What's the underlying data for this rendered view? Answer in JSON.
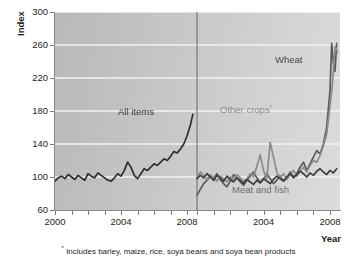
{
  "axes": {
    "ylabel": "Index",
    "xlabel": "Year",
    "yticks": [
      "60",
      "100",
      "140",
      "180",
      "220",
      "260",
      "300"
    ],
    "xticks_left": [
      "2000",
      "2004",
      "2008"
    ],
    "xticks_right": [
      "2004",
      "2008"
    ]
  },
  "labels": {
    "all_items": "All items",
    "wheat": "Wheat",
    "other_crops": "Other crops",
    "other_crops_star": "*",
    "meat_and_fish": "Meat and fish"
  },
  "footnote": {
    "star": "*",
    "text": "Includes barley, maize, rice, soya beans and soya bean products"
  },
  "colors": {
    "all_items": "#2f2f2f",
    "wheat": "#5a5a5a",
    "other_crops": "#8c8c8c",
    "meat_and_fish": "#3f3f3f",
    "gridline": "#f2f2f2",
    "axis": "#8a8a8a",
    "divider": "#7a7a7a",
    "plot_bg_left": "#bcbcbc",
    "plot_bg_right": "#dadada"
  },
  "chart_data": {
    "type": "line",
    "title": "",
    "xlabel": "Year",
    "ylabel": "Index",
    "ylim": [
      60,
      300
    ],
    "yticks": [
      60,
      100,
      140,
      180,
      220,
      260,
      300
    ],
    "grid": true,
    "legend": "inline-annotations",
    "panels": [
      {
        "name": "left",
        "xlim": [
          2000,
          2008.6
        ],
        "xticks": [
          2000,
          2004,
          2008
        ],
        "series": [
          {
            "name": "All items",
            "color": "#2f2f2f",
            "x": [
              2000.0,
              2000.2,
              2000.4,
              2000.6,
              2000.8,
              2001.0,
              2001.2,
              2001.4,
              2001.6,
              2001.8,
              2002.0,
              2002.2,
              2002.4,
              2002.6,
              2002.8,
              2003.0,
              2003.2,
              2003.4,
              2003.6,
              2003.8,
              2004.0,
              2004.2,
              2004.4,
              2004.6,
              2004.8,
              2005.0,
              2005.2,
              2005.4,
              2005.6,
              2005.8,
              2006.0,
              2006.2,
              2006.4,
              2006.6,
              2006.8,
              2007.0,
              2007.2,
              2007.4,
              2007.6,
              2007.8,
              2008.0,
              2008.2,
              2008.35
            ],
            "y": [
              95,
              99,
              101,
              98,
              103,
              100,
              97,
              102,
              99,
              96,
              104,
              101,
              99,
              105,
              102,
              99,
              96,
              95,
              99,
              104,
              101,
              108,
              118,
              112,
              102,
              98,
              104,
              110,
              108,
              112,
              116,
              114,
              118,
              122,
              120,
              125,
              131,
              129,
              134,
              140,
              150,
              163,
              176
            ]
          }
        ]
      },
      {
        "name": "right",
        "xlim": [
          2000,
          2008.6
        ],
        "xticks": [
          2004,
          2008
        ],
        "series": [
          {
            "name": "Wheat",
            "color": "#5a5a5a",
            "x": [
              2000.0,
              2000.2,
              2000.4,
              2000.6,
              2000.8,
              2001.0,
              2001.2,
              2001.4,
              2001.6,
              2001.8,
              2002.0,
              2002.2,
              2002.4,
              2002.6,
              2002.8,
              2003.0,
              2003.2,
              2003.4,
              2003.6,
              2003.8,
              2004.0,
              2004.2,
              2004.4,
              2004.6,
              2004.8,
              2005.0,
              2005.2,
              2005.4,
              2005.6,
              2005.8,
              2006.0,
              2006.2,
              2006.4,
              2006.6,
              2006.8,
              2007.0,
              2007.2,
              2007.4,
              2007.6,
              2007.8,
              2008.0,
              2008.1,
              2008.2,
              2008.3,
              2008.4
            ],
            "y": [
              78,
              85,
              92,
              96,
              101,
              98,
              104,
              97,
              92,
              88,
              95,
              103,
              99,
              94,
              90,
              96,
              101,
              106,
              99,
              93,
              97,
              104,
              98,
              92,
              96,
              101,
              95,
              99,
              106,
              100,
              104,
              112,
              118,
              108,
              116,
              124,
              132,
              128,
              140,
              160,
              205,
              262,
              238,
              228,
              262
            ]
          },
          {
            "name": "Other crops",
            "color": "#8c8c8c",
            "x": [
              2000.0,
              2000.2,
              2000.4,
              2000.6,
              2000.8,
              2001.0,
              2001.2,
              2001.4,
              2001.6,
              2001.8,
              2002.0,
              2002.2,
              2002.4,
              2002.6,
              2002.8,
              2003.0,
              2003.2,
              2003.4,
              2003.6,
              2003.8,
              2004.0,
              2004.2,
              2004.4,
              2004.6,
              2004.8,
              2005.0,
              2005.2,
              2005.4,
              2005.6,
              2005.8,
              2006.0,
              2006.2,
              2006.4,
              2006.6,
              2006.8,
              2007.0,
              2007.2,
              2007.4,
              2007.6,
              2007.8,
              2008.0,
              2008.15,
              2008.3,
              2008.45
            ],
            "y": [
              100,
              106,
              102,
              97,
              103,
              99,
              95,
              101,
              98,
              94,
              100,
              97,
              103,
              99,
              95,
              98,
              104,
              100,
              113,
              127,
              108,
              98,
              142,
              124,
              106,
              99,
              104,
              97,
              103,
              108,
              101,
              107,
              112,
              106,
              114,
              120,
              118,
              126,
              138,
              152,
              186,
              214,
              258,
              252
            ]
          },
          {
            "name": "Meat and fish",
            "color": "#3f3f3f",
            "x": [
              2000.0,
              2000.2,
              2000.4,
              2000.6,
              2000.8,
              2001.0,
              2001.2,
              2001.4,
              2001.6,
              2001.8,
              2002.0,
              2002.2,
              2002.4,
              2002.6,
              2002.8,
              2003.0,
              2003.2,
              2003.4,
              2003.6,
              2003.8,
              2004.0,
              2004.2,
              2004.4,
              2004.6,
              2004.8,
              2005.0,
              2005.2,
              2005.4,
              2005.6,
              2005.8,
              2006.0,
              2006.2,
              2006.4,
              2006.6,
              2006.8,
              2007.0,
              2007.2,
              2007.4,
              2007.6,
              2007.8,
              2008.0,
              2008.2,
              2008.4
            ],
            "y": [
              98,
              102,
              99,
              104,
              100,
              96,
              102,
              99,
              95,
              101,
              97,
              94,
              99,
              96,
              92,
              97,
              94,
              91,
              96,
              93,
              98,
              95,
              92,
              97,
              101,
              98,
              95,
              100,
              104,
              99,
              103,
              107,
              104,
              100,
              105,
              102,
              107,
              110,
              106,
              103,
              108,
              105,
              110
            ]
          }
        ]
      }
    ]
  }
}
